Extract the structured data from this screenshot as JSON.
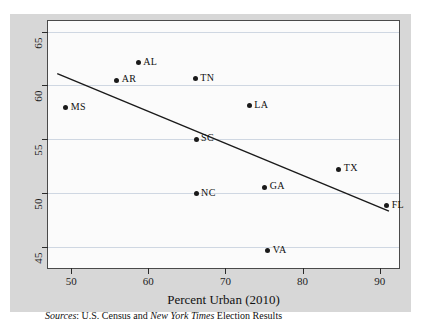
{
  "figure": {
    "background_color": "#d7d7d7",
    "plot_background_color": "#fbfbfb",
    "frame_color": "#4a4a4a",
    "grid_color": "#cfd7e2",
    "marker_color": "#1a1a1a",
    "trendline_color": "#1a1a1a"
  },
  "source_note": {
    "prefix": "Sources",
    "separator": ": ",
    "part1": "U.S. Census and ",
    "italic_source": "New York Times",
    "part2": " Election Results"
  },
  "chart_data": {
    "type": "scatter",
    "title": "",
    "xlabel": "Percent Urban (2010)",
    "ylabel": "",
    "xlim": [
      47.0,
      92.5
    ],
    "ylim": [
      43.0,
      66.0
    ],
    "xticks": [
      50,
      60,
      70,
      80,
      90
    ],
    "xtick_labels": [
      "50",
      "60",
      "70",
      "80",
      "90"
    ],
    "yticks": [
      45,
      50,
      55,
      60,
      65
    ],
    "ytick_labels": [
      "45",
      "50",
      "55",
      "60",
      "65"
    ],
    "grid": "horizontal",
    "legend": "none",
    "point_labels": [
      "MS",
      "AR",
      "AL",
      "TN",
      "LA",
      "SC",
      "TX",
      "GA",
      "NC",
      "FL",
      "VA"
    ],
    "x": [
      49.3,
      55.9,
      58.7,
      66.1,
      73.1,
      66.2,
      84.7,
      75.1,
      66.2,
      90.9,
      75.5
    ],
    "y": [
      57.9,
      60.5,
      62.1,
      60.6,
      58.1,
      55.0,
      52.2,
      50.5,
      49.9,
      48.8,
      44.6
    ],
    "points": [
      {
        "label": "MS",
        "x": 49.3,
        "y": 57.9
      },
      {
        "label": "AR",
        "x": 55.9,
        "y": 60.5
      },
      {
        "label": "AL",
        "x": 58.7,
        "y": 62.1
      },
      {
        "label": "TN",
        "x": 66.1,
        "y": 60.6
      },
      {
        "label": "LA",
        "x": 73.1,
        "y": 58.1
      },
      {
        "label": "SC",
        "x": 66.2,
        "y": 55.0
      },
      {
        "label": "TX",
        "x": 84.7,
        "y": 52.2
      },
      {
        "label": "GA",
        "x": 75.1,
        "y": 50.5
      },
      {
        "label": "NC",
        "x": 66.2,
        "y": 49.9
      },
      {
        "label": "FL",
        "x": 90.9,
        "y": 48.8
      },
      {
        "label": "VA",
        "x": 75.5,
        "y": 44.6
      }
    ],
    "trendline": {
      "type": "linear-fit",
      "x_start": 48.2,
      "y_start": 61.1,
      "x_end": 91.2,
      "y_end": 48.3
    }
  }
}
